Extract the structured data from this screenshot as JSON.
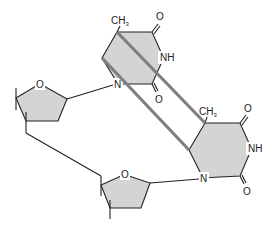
{
  "colors": {
    "ring_fill": "#d4d4d4",
    "line": "#222222",
    "cyclobutane_bond": "#7f7f7f",
    "background": "#ffffff"
  },
  "top_base": {
    "methyl": "CH",
    "methyl_sub": "3",
    "carbonyl_top": "O",
    "imino": "NH",
    "ring_n": "N",
    "carbonyl_bottom": "O"
  },
  "bottom_base": {
    "methyl": "CH",
    "methyl_sub": "3",
    "carbonyl_top": "O",
    "imino": "NH",
    "ring_n": "N",
    "carbonyl_bottom": "O"
  },
  "top_sugar": {
    "ring_o": "O"
  },
  "bottom_sugar": {
    "ring_o": "O"
  }
}
